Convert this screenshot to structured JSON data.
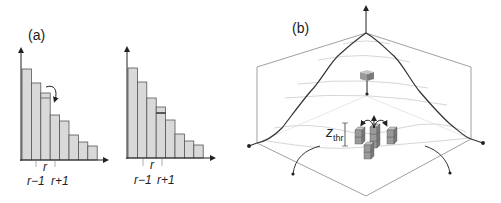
{
  "figure": {
    "panel_a_label": "(a)",
    "panel_b_label": "(b)",
    "histogram_before": {
      "tick_labels": {
        "r_minus_1": "r−1",
        "r": "r",
        "r_plus_1": "r+1"
      },
      "bar_heights": [
        91,
        77,
        67,
        45,
        39,
        25,
        18,
        14
      ],
      "moving_unit_line": 62
    },
    "histogram_after": {
      "tick_labels": {
        "r_minus_1": "r−1",
        "r": "r",
        "r_plus_1": "r+1"
      },
      "bar_heights": [
        90,
        76,
        60,
        51,
        38,
        24,
        17,
        13
      ],
      "received_unit_line": 45
    },
    "sandpile": {
      "threshold_label": "z",
      "threshold_sub": "thr"
    },
    "colors": {
      "bar_fill": "#d9d9d9",
      "bar_stroke": "#555555",
      "axis": "#222222",
      "surface_curve": "#333333",
      "frame": "#888888",
      "contour": "#cccccc",
      "cube_front": "#9a9a9a",
      "cube_top": "#c4c4c4",
      "cube_side": "#7a7a7a"
    }
  }
}
